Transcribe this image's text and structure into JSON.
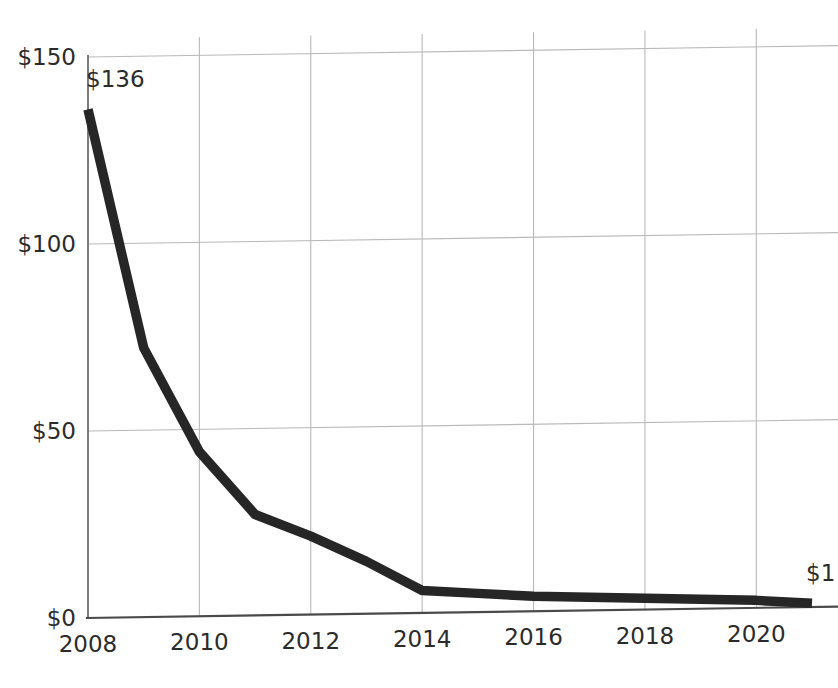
{
  "chart_data": {
    "type": "line",
    "title": "",
    "subtitle": "",
    "xlabel": "",
    "ylabel": "",
    "x": [
      2008,
      2009,
      2010,
      2011,
      2012,
      2013,
      2014,
      2015,
      2016,
      2017,
      2018,
      2019,
      2020,
      2021
    ],
    "values": [
      136,
      72,
      44,
      27,
      21,
      14,
      6,
      5,
      4,
      3.5,
      3,
      2.5,
      2,
      1
    ],
    "series": [
      {
        "name": "Cost",
        "values": [
          136,
          72,
          44,
          27,
          21,
          14,
          6,
          5,
          4,
          3.5,
          3,
          2.5,
          2,
          1
        ],
        "color": "#262626"
      }
    ],
    "xlim": [
      2008,
      2021
    ],
    "ylim": [
      0,
      150
    ],
    "xticks": [
      2008,
      2010,
      2012,
      2014,
      2016,
      2018,
      2020
    ],
    "xtick_labels": [
      "2008",
      "2010",
      "2012",
      "2014",
      "2016",
      "2018",
      "2020"
    ],
    "yticks": [
      0,
      50,
      100,
      150
    ],
    "ytick_labels": [
      "$0",
      "$50",
      "$100",
      "$150"
    ],
    "grid": true,
    "grid_color": "#b9b9b9",
    "legend": false,
    "legend_position": "none",
    "annotations": [
      {
        "name": "first-point-label",
        "text": "$136",
        "x": 2008,
        "y": 136,
        "align": "start"
      },
      {
        "name": "last-point-label",
        "text": "$1",
        "x": 2021,
        "y": 1,
        "align": "end"
      }
    ],
    "colors": {
      "line": "#262626",
      "grid": "#b9b9b9",
      "axis": "#4a4a4a",
      "text": "#2b2b2b",
      "background": "#ffffff"
    }
  }
}
